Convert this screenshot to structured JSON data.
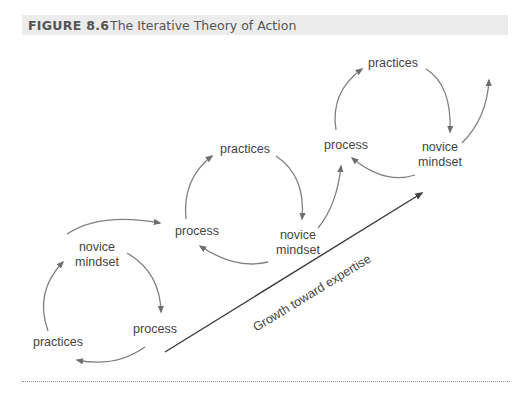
{
  "figure": {
    "number": "FIGURE 8.6",
    "title": "The Iterative Theory of Action"
  },
  "cycles": [
    {
      "name": "cycle-1",
      "novice_line1": "novice",
      "novice_line2": "mindset",
      "process": "process",
      "practices": "practices"
    },
    {
      "name": "cycle-2",
      "practices": "practices",
      "process": "process",
      "novice_line1": "novice",
      "novice_line2": "mindset"
    },
    {
      "name": "cycle-3",
      "practices": "practices",
      "process": "process",
      "novice_line1": "novice",
      "novice_line2": "mindset"
    }
  ],
  "growth_arrow": {
    "label": "Growth toward expertise"
  },
  "colors": {
    "header_bg": "#ececec",
    "arrow": "#777777",
    "text": "#444444"
  }
}
